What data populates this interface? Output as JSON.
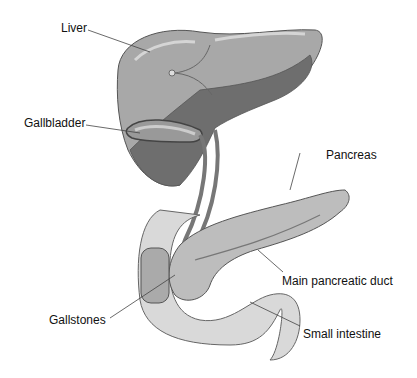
{
  "diagram": {
    "labels": {
      "liver": "Liver",
      "gallbladder": "Gallbladder",
      "pancreas": "Pancreas",
      "main_pancreatic_duct": "Main pancreatic duct",
      "gallstones": "Gallstones",
      "small_intestine": "Small intestine"
    },
    "colors": {
      "liver_light": "#a8a8a8",
      "liver_dark": "#6e6e6e",
      "pancreas": "#bdbdbd",
      "intestine": "#d9d9d9",
      "outline": "#555555"
    }
  }
}
